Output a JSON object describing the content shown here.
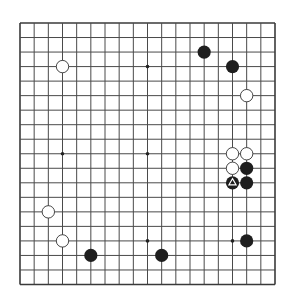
{
  "board": {
    "size": 19,
    "left": 20,
    "top": 23,
    "right": 275,
    "bottom": 284.5,
    "line_color": "#4a4a4a",
    "border_color": "#3a3a3a",
    "background": "#ffffff",
    "stone_radius": 6.6
  },
  "colors": {
    "black_stone": "#1e1e1e",
    "white_stone_fill": "#ffffff",
    "white_stone_stroke": "#333333",
    "marker": "#ffffff"
  },
  "star_points": [
    [
      3,
      3
    ],
    [
      9,
      3
    ],
    [
      15,
      3
    ],
    [
      3,
      9
    ],
    [
      9,
      9
    ],
    [
      15,
      9
    ],
    [
      3,
      15
    ],
    [
      9,
      15
    ],
    [
      15,
      15
    ]
  ],
  "stones": [
    {
      "color": "white",
      "col": 3,
      "row": 3
    },
    {
      "color": "black",
      "col": 13,
      "row": 2
    },
    {
      "color": "black",
      "col": 15,
      "row": 3
    },
    {
      "color": "white",
      "col": 16,
      "row": 5
    },
    {
      "color": "white",
      "col": 15,
      "row": 9
    },
    {
      "color": "white",
      "col": 16,
      "row": 9
    },
    {
      "color": "white",
      "col": 15,
      "row": 10
    },
    {
      "color": "black",
      "col": 16,
      "row": 10
    },
    {
      "color": "black",
      "col": 15,
      "row": 11,
      "marker": "triangle"
    },
    {
      "color": "black",
      "col": 16,
      "row": 11
    },
    {
      "color": "white",
      "col": 2,
      "row": 13
    },
    {
      "color": "white",
      "col": 3,
      "row": 15
    },
    {
      "color": "black",
      "col": 16,
      "row": 15
    },
    {
      "color": "black",
      "col": 5,
      "row": 16
    },
    {
      "color": "black",
      "col": 10,
      "row": 16
    }
  ]
}
